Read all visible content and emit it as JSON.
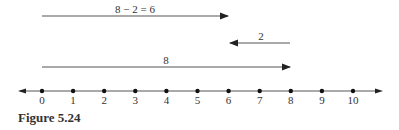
{
  "figure": {
    "caption": "Figure 5.24",
    "number_line": {
      "min": 0,
      "max": 10,
      "ticks": [
        "0",
        "1",
        "2",
        "3",
        "4",
        "5",
        "6",
        "7",
        "8",
        "9",
        "10"
      ]
    },
    "arrows": [
      {
        "label": "8 − 2 = 6",
        "from": 0,
        "to": 6,
        "direction": "right"
      },
      {
        "label": "2",
        "from": 8,
        "to": 6,
        "direction": "left"
      },
      {
        "label": "8",
        "from": 0,
        "to": 8,
        "direction": "right"
      }
    ]
  }
}
